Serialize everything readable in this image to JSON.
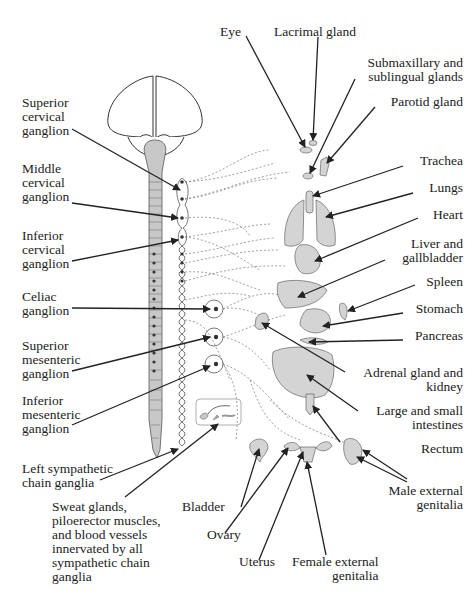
{
  "colors": {
    "organ_fill": "#d4d4d4",
    "organ_stroke": "#666666",
    "line": "#222222",
    "dashed_nerve": "#777777"
  },
  "left_labels": {
    "superior_cervical": "Superior\ncervical\nganglion",
    "middle_cervical": "Middle\ncervical\nganglion",
    "inferior_cervical": "Inferior\ncervical\nganglion",
    "celiac": "Celiac\nganglion",
    "superior_mesenteric": "Superior\nmesenteric\nganglion",
    "inferior_mesenteric": "Inferior\nmesenteric\nganglion",
    "left_chain": "Left sympathetic\nchain ganglia",
    "sweat_glands": "Sweat glands,\npiloerector muscles,\nand blood vessels\ninnervated by all\nsympathetic chain\nganglia"
  },
  "right_labels": {
    "eye": "Eye",
    "lacrimal": "Lacrimal gland",
    "submaxillary": "Submaxillary and\nsublingual glands",
    "parotid": "Parotid gland",
    "trachea": "Trachea",
    "lungs": "Lungs",
    "heart": "Heart",
    "liver": "Liver and\ngallbladder",
    "spleen": "Spleen",
    "stomach": "Stomach",
    "pancreas": "Pancreas",
    "adrenal": "Adrenal gland and\nkidney",
    "intestines": "Large and small\nintestines",
    "rectum": "Rectum",
    "male_genitalia": "Male external\ngenitalia"
  },
  "bottom_labels": {
    "bladder": "Bladder",
    "ovary": "Ovary",
    "uterus": "Uterus",
    "female_genitalia": "Female external\ngenitalia"
  }
}
